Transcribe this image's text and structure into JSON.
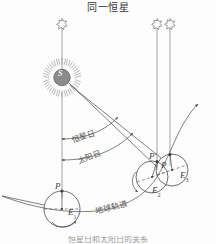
{
  "figure": {
    "title": "同一恒星",
    "caption": "恒星日和太阳日的关系",
    "labels": {
      "sidereal_day": "恒星日",
      "solar_day": "太阳日",
      "earth_orbit": "地球轨道",
      "sun": "S",
      "earth_1": "E",
      "earth_1_sub": "1",
      "earth_2": "E",
      "earth_2_sub": "2",
      "earth_3": "E",
      "earth_3_sub": "3",
      "point_p1": "P",
      "point_p2": "P",
      "point_p2_prime": "P′",
      "point_p3": "P"
    },
    "colors": {
      "line": "#4a4a4a",
      "sun_fill": "#8c8c8c",
      "background": "#fdfdfd",
      "text": "#3a3a3a",
      "caption": "#9a9a9a"
    },
    "icons": {
      "star_left": "star-icon",
      "star_right_1": "star-icon",
      "star_right_2": "star-icon"
    }
  }
}
